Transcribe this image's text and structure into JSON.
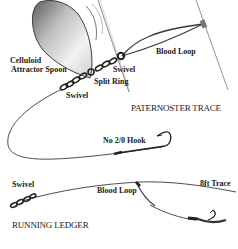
{
  "diagram": {
    "paternoster": {
      "title": "PATERNOSTER TRACE",
      "labels": {
        "spoon": [
          "Celluloid",
          "Attractor Spoon"
        ],
        "split_ring": "Split Ring",
        "swivel_upper": "Swivel",
        "swivel_lower": "Swivel",
        "blood_loop": "Blood Loop",
        "hook": "No 2/0 Hook"
      }
    },
    "running_ledger": {
      "title": "RUNNING LEDGER",
      "labels": {
        "swivel": "Swivel",
        "blood_loop": "Blood Loop",
        "trace": "8ft Trace"
      }
    },
    "colors": {
      "line": "#3a3a3a",
      "text": "#1a1a1a",
      "spoon_dark": "#4a4a4a",
      "spoon_light": "#e8e8e8"
    }
  }
}
